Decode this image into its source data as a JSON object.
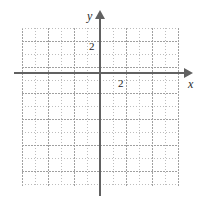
{
  "figure": {
    "type": "coordinate-grid"
  },
  "chart_data": {
    "type": "scatter",
    "title": "",
    "subtitle": "",
    "xlabel": "x",
    "ylabel": "y",
    "xlim": [
      -6,
      6
    ],
    "ylim": [
      -8.5,
      3.5
    ],
    "xticks": [
      2
    ],
    "yticks": [
      2
    ],
    "xticklabels": [
      "2"
    ],
    "yticklabels": [
      "2"
    ],
    "grid": true,
    "grid_style": "dotted",
    "grid_minor_step": 1,
    "grid_major_step": 2,
    "legend": false,
    "series": [],
    "x": [],
    "values": [],
    "annotations": []
  },
  "axes": {
    "x_label": "x",
    "y_label": "y",
    "axis_color": "#616161",
    "origin_label": ""
  },
  "ticks": {
    "x_two": "2",
    "y_two": "2"
  },
  "colors": {
    "axis": "#616161",
    "grid_minor": "#bdbdbd",
    "grid_major": "#a0a0a0",
    "background": "#ffffff",
    "text": "#1e1e1e"
  }
}
